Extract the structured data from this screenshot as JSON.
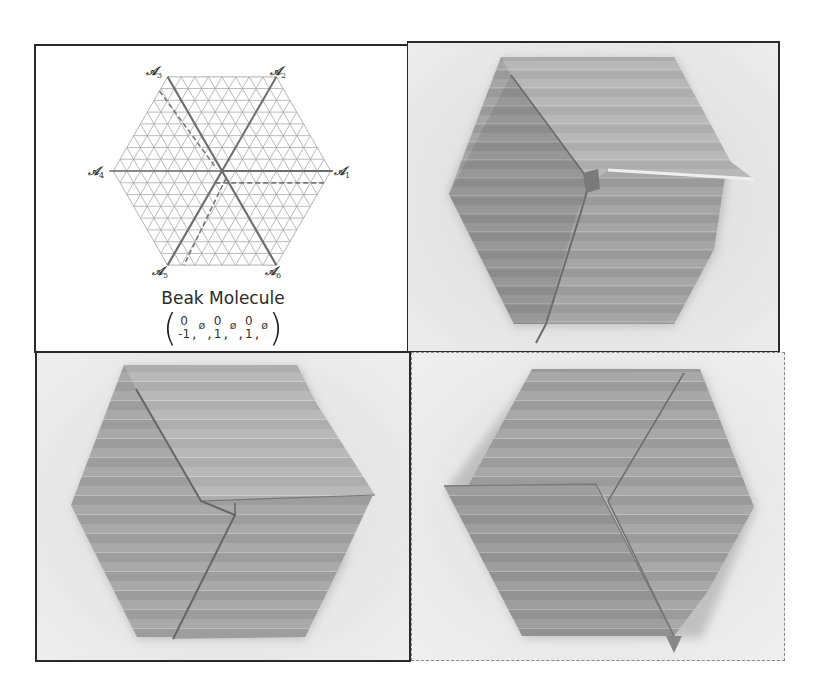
{
  "figure": {
    "panels": [
      {
        "id": "diagram",
        "position": "top-left",
        "type": "crease-pattern-diagram",
        "axis_labels": [
          {
            "name": "A1",
            "glyph": "𝒜",
            "sub": "1"
          },
          {
            "name": "A2",
            "glyph": "𝒜",
            "sub": "2"
          },
          {
            "name": "A3",
            "glyph": "𝒜",
            "sub": "3"
          },
          {
            "name": "A4",
            "glyph": "𝒜",
            "sub": "4"
          },
          {
            "name": "A5",
            "glyph": "𝒜",
            "sub": "5"
          },
          {
            "name": "A6",
            "glyph": "𝒜",
            "sub": "6"
          }
        ],
        "title": "Beak Molecule",
        "vector": {
          "open": "(",
          "close": ")",
          "entries": [
            {
              "top": "0",
              "bottom": "-1"
            },
            {
              "single": "ø"
            },
            {
              "top": "0",
              "bottom": "1"
            },
            {
              "single": "ø"
            },
            {
              "top": "0",
              "bottom": "1"
            },
            {
              "single": "ø"
            }
          ],
          "comma": ","
        }
      },
      {
        "id": "photo-1",
        "position": "top-right",
        "type": "photo",
        "subject": "folded paper hexagon, beak molecule partially collapsed"
      },
      {
        "id": "photo-2",
        "position": "bottom-left",
        "type": "photo",
        "subject": "folded paper hexagon, beak molecule flattened"
      },
      {
        "id": "photo-3",
        "position": "bottom-right",
        "type": "photo",
        "subject": "folded paper hexagon, pinwheel-like flat fold",
        "border": "dashed"
      }
    ],
    "colors": {
      "frame": "#2a2a2a",
      "grid": "#a9a9a9",
      "axis_line": "#6e6e6e",
      "photo_background": "#e5e5e5",
      "paper_dark": "#8e8e8e",
      "paper_mid": "#9f9f9f",
      "paper_light": "#b4b4b4"
    }
  }
}
